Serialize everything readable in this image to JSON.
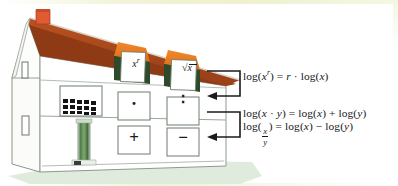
{
  "palette": {
    "roof": "#a8481e",
    "roof_shadow": "#8d3a15",
    "dormer_roof": "#e8761f",
    "dormer_shade": "#2d4a2a",
    "chimney": "#e05a32",
    "chimney_dark": "#b8432220",
    "wall": "#ffffff",
    "wall_side": "#f2f2ee",
    "outline": "#6d7a6d",
    "ground": "#d9e8d8",
    "column": "#4e7a45",
    "ink": "#17181a",
    "page_tint": "#f2f3d8"
  },
  "house": {
    "attic": {
      "name": "attic-floor",
      "windows": [
        {
          "id": "window-power",
          "glyph": "x",
          "exponent": "r",
          "kind": "power",
          "label": "x to the power r"
        },
        {
          "id": "window-root",
          "glyph": "x",
          "kind": "root",
          "label": "square root of x"
        }
      ]
    },
    "middle": {
      "name": "middle-floor",
      "windows": [
        {
          "id": "window-grid",
          "kind": "lattice",
          "label": "multiplication grid window",
          "rows": 4,
          "cols": 6
        },
        {
          "id": "window-multiply",
          "glyph": "·",
          "kind": "operator",
          "label": "multiplication dot"
        },
        {
          "id": "window-divide",
          "glyph": "∶",
          "kind": "operator",
          "label": "division colon"
        }
      ]
    },
    "ground": {
      "name": "ground-floor",
      "windows": [
        {
          "id": "window-plus",
          "glyph": "+",
          "kind": "operator",
          "label": "plus sign"
        },
        {
          "id": "window-minus",
          "glyph": "−",
          "kind": "operator",
          "label": "minus sign"
        }
      ],
      "column": {
        "id": "entry-column",
        "label": "green striped column"
      }
    },
    "side_windows": [
      {
        "id": "side-window-upper",
        "label": "narrow gable window upper"
      },
      {
        "id": "side-window-lower",
        "label": "narrow gable window lower"
      }
    ],
    "chimney": {
      "id": "chimney",
      "label": "chimney"
    }
  },
  "connectors": [
    {
      "id": "connector-power",
      "label": "arrow from power law to attic level",
      "from": "formula-power",
      "to": "middle-floor"
    },
    {
      "id": "connector-product",
      "label": "arrow from product and quotient laws to ground level",
      "from": "formula-product",
      "to": "ground-floor"
    }
  ],
  "formulas": {
    "power": {
      "id": "formula-power",
      "lhs_log": "log",
      "lhs_open": "(",
      "lhs_base": "x",
      "lhs_exp": "r",
      "lhs_close": ")",
      "equals": "=",
      "rhs_coeff": "r",
      "rhs_dot": "·",
      "rhs_log": "log",
      "rhs_open": "(",
      "rhs_arg": "x",
      "rhs_close": ")",
      "plain": "log (x^r) = r · log (x)"
    },
    "product": {
      "id": "formula-product",
      "lhs_log": "log",
      "lhs_open": "(",
      "lhs_a": "x",
      "lhs_op": "·",
      "lhs_b": "y",
      "lhs_close": ")",
      "equals": "=",
      "r1_log": "log",
      "r1_open": "(",
      "r1_arg": "x",
      "r1_close": ")",
      "op": "+",
      "r2_log": "log",
      "r2_open": "(",
      "r2_arg": "y",
      "r2_close": ")",
      "plain": "log (x · y) = log (x) + log (y)"
    },
    "quotient": {
      "id": "formula-quotient",
      "lhs_log": "log",
      "lhs_open": "(",
      "num": "x",
      "den": "y",
      "lhs_close": ")",
      "equals": "=",
      "r1_log": "log",
      "r1_open": "(",
      "r1_arg": "x",
      "r1_close": ")",
      "op": "−",
      "r2_log": "log",
      "r2_open": "(",
      "r2_arg": "y",
      "r2_close": ")",
      "plain": "log (x/y) = log (x) − log (y)"
    }
  }
}
